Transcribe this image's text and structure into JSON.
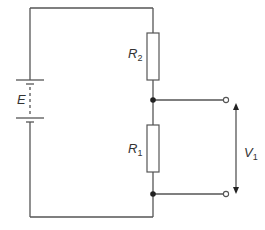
{
  "diagram": {
    "type": "circuit",
    "colors": {
      "line": "#555555",
      "text": "#333333",
      "background": "#ffffff"
    },
    "components": {
      "battery": {
        "label": "E"
      },
      "resistor_top": {
        "label": "R",
        "subscript": "2"
      },
      "resistor_bottom": {
        "label": "R",
        "subscript": "1"
      },
      "output_voltage": {
        "label": "V",
        "subscript": "1"
      }
    }
  }
}
